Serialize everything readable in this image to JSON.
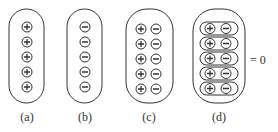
{
  "figure": {
    "panels": [
      {
        "id": "a",
        "label": "(a)",
        "columns": [
          "+"
        ],
        "rows": 5,
        "description": "positive charges only"
      },
      {
        "id": "b",
        "label": "(b)",
        "columns": [
          "-"
        ],
        "rows": 5,
        "description": "negative charges only"
      },
      {
        "id": "c",
        "label": "(c)",
        "columns": [
          "+",
          "-"
        ],
        "rows": 5,
        "description": "positive and negative charges side by side"
      },
      {
        "id": "d",
        "label": "(d)",
        "columns": [
          "+",
          "-"
        ],
        "rows": 5,
        "paired": true,
        "description": "charges grouped in neutral pairs"
      }
    ],
    "equation": "= 0",
    "colors": {
      "stroke": "#333333",
      "background": "#ffffff"
    }
  }
}
